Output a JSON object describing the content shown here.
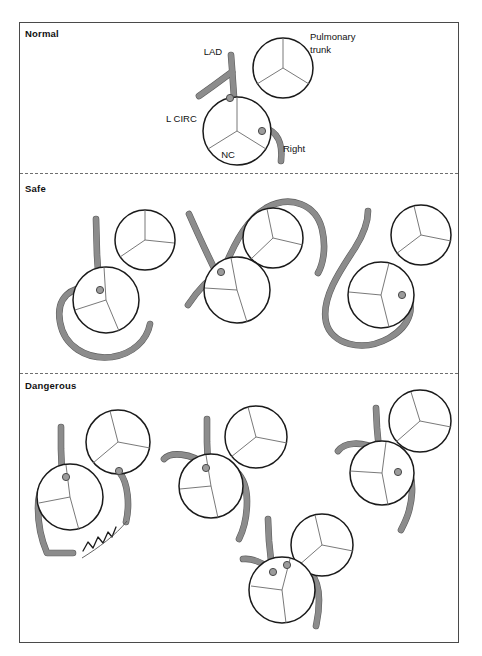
{
  "figure": {
    "title_visible": false,
    "background_color": "#ffffff",
    "frame_color": "#4a4a4a",
    "vessel_fill_color": "#8c8c8c",
    "vessel_edge_color": "#5d5d5d",
    "ostium_color": "#9b9b9b",
    "cusp_line_color": "#6a6a6a"
  },
  "sections": [
    {
      "id": "normal",
      "label": "Normal"
    },
    {
      "id": "safe",
      "label": "Safe"
    },
    {
      "id": "dangerous",
      "label": "Dangerous"
    }
  ],
  "annotations": [
    {
      "id": "lad",
      "text": "LAD",
      "x": 213,
      "y": 55
    },
    {
      "id": "l-circ",
      "text": "L CIRC",
      "x": 166,
      "y": 122
    },
    {
      "id": "nc",
      "text": "NC",
      "x": 228,
      "y": 158
    },
    {
      "id": "right",
      "text": "Right",
      "x": 283,
      "y": 152
    },
    {
      "id": "pulmonary-1",
      "text": "Pulmonary",
      "x": 310,
      "y": 40
    },
    {
      "id": "pulmonary-2",
      "text": "trunk",
      "x": 310,
      "y": 53
    }
  ],
  "panels": {
    "normal": [
      {
        "id": "normal-1",
        "aortic_root": {
          "cx": 237,
          "cy": 131,
          "r": 34
        },
        "pulmonary_trunk": {
          "cx": 283,
          "cy": 68,
          "r": 30
        },
        "ostia": [
          {
            "cx": 230,
            "cy": 98,
            "r": 3.6,
            "vessel": "left-main"
          },
          {
            "cx": 262,
            "cy": 131,
            "r": 3.6,
            "vessel": "right"
          }
        ]
      }
    ],
    "safe": [
      {
        "id": "safe-1",
        "description": "retroaortic course",
        "aortic_root": {
          "cx": 106,
          "cy": 300,
          "r": 33
        },
        "pulmonary_trunk": {
          "cx": 145,
          "cy": 240,
          "r": 30
        },
        "ostia": [
          {
            "cx": 100,
            "cy": 290,
            "r": 3.6
          }
        ]
      },
      {
        "id": "safe-2",
        "description": "prepulmonic course",
        "aortic_root": {
          "cx": 237,
          "cy": 290,
          "r": 33
        },
        "pulmonary_trunk": {
          "cx": 273,
          "cy": 238,
          "r": 30
        },
        "ostia": [
          {
            "cx": 221,
            "cy": 272,
            "r": 3.6
          }
        ]
      },
      {
        "id": "safe-3",
        "description": "retroaortic course from right sinus",
        "aortic_root": {
          "cx": 381,
          "cy": 295,
          "r": 33
        },
        "pulmonary_trunk": {
          "cx": 421,
          "cy": 235,
          "r": 30
        },
        "ostia": [
          {
            "cx": 402,
            "cy": 295,
            "r": 3.6
          }
        ]
      }
    ],
    "dangerous": [
      {
        "id": "dangerous-1",
        "description": "anomalous origin from pulmonary trunk with collateral",
        "aortic_root": {
          "cx": 70,
          "cy": 497,
          "r": 33
        },
        "pulmonary_trunk": {
          "cx": 118,
          "cy": 442,
          "r": 32
        },
        "ostia": [
          {
            "cx": 66,
            "cy": 477,
            "r": 3.6
          },
          {
            "cx": 119,
            "cy": 471,
            "r": 3.6
          }
        ],
        "has_collateral_squiggle": true
      },
      {
        "id": "dangerous-2",
        "description": "interarterial course",
        "aortic_root": {
          "cx": 211,
          "cy": 486,
          "r": 32
        },
        "pulmonary_trunk": {
          "cx": 256,
          "cy": 437,
          "r": 31
        },
        "ostia": [
          {
            "cx": 206,
            "cy": 468,
            "r": 3.6
          }
        ]
      },
      {
        "id": "dangerous-3",
        "description": "interarterial course from left sinus",
        "aortic_root": {
          "cx": 382,
          "cy": 473,
          "r": 32
        },
        "pulmonary_trunk": {
          "cx": 420,
          "cy": 421,
          "r": 31
        },
        "ostia": [
          {
            "cx": 398,
            "cy": 472,
            "r": 3.6
          }
        ]
      },
      {
        "id": "dangerous-4",
        "description": "single coronary ostium",
        "aortic_root": {
          "cx": 282,
          "cy": 590,
          "r": 33
        },
        "pulmonary_trunk": {
          "cx": 322,
          "cy": 545,
          "r": 31
        },
        "ostia": [
          {
            "cx": 273,
            "cy": 572,
            "r": 3.6
          },
          {
            "cx": 287,
            "cy": 565,
            "r": 3.6
          }
        ]
      }
    ]
  }
}
